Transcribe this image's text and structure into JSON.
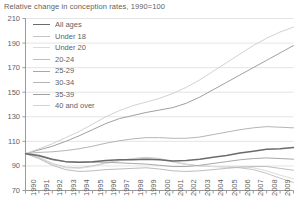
{
  "chart_data": {
    "type": "line",
    "title": "Relative change in conception rates, 1990=100",
    "xlabel": "",
    "ylabel": "",
    "grid": true,
    "legend_position": "top-left",
    "xlim": [
      1990,
      2010
    ],
    "ylim": [
      70,
      210
    ],
    "yticks": [
      70,
      90,
      110,
      130,
      150,
      170,
      190,
      210
    ],
    "x": [
      1990,
      1991,
      1992,
      1993,
      1994,
      1995,
      1996,
      1997,
      1998,
      1999,
      2000,
      2001,
      2002,
      2003,
      2004,
      2005,
      2006,
      2007,
      2008,
      2009,
      2010
    ],
    "xticklabels": [
      "1990",
      "1991",
      "1992",
      "1993",
      "1994",
      "1995",
      "1996",
      "1997",
      "1998",
      "1999",
      "2000",
      "2001",
      "2002",
      "2003",
      "2004",
      "2005",
      "2006",
      "2007",
      "2008",
      "2009",
      "2010"
    ],
    "series": [
      {
        "name": "All ages",
        "color": "#6b6b6b",
        "width": 1.5,
        "values": [
          100,
          98.5,
          95.5,
          93.5,
          93,
          93.5,
          94.5,
          95,
          95,
          95.5,
          95,
          94,
          94.5,
          95.5,
          97,
          98.5,
          100.5,
          102,
          103.5,
          104,
          105
        ]
      },
      {
        "name": "Under 18",
        "color": "#c4c4c4",
        "width": 1.0,
        "values": [
          100,
          97,
          92,
          89,
          88.5,
          90,
          92.5,
          94.5,
          96,
          97,
          96,
          93.5,
          91.5,
          90,
          89.5,
          89,
          88.5,
          87,
          84,
          80,
          76.5
        ]
      },
      {
        "name": "Under 20",
        "color": "#dcdcdc",
        "width": 1.0,
        "values": [
          100,
          96.5,
          91.5,
          88.5,
          88,
          89.5,
          92,
          94,
          95.5,
          96.5,
          95.5,
          93,
          91,
          90,
          89.5,
          89.5,
          89.5,
          88.5,
          86,
          82.5,
          79.5
        ]
      },
      {
        "name": "20-24",
        "color": "#bdbdbd",
        "width": 1.0,
        "values": [
          100,
          96,
          90.5,
          87,
          85.5,
          86,
          87,
          87.5,
          88,
          88.5,
          87.5,
          86,
          85.5,
          86,
          87,
          88,
          89,
          89.5,
          89.5,
          88,
          86.5
        ]
      },
      {
        "name": "25-29",
        "color": "#a8a8a8",
        "width": 1.0,
        "values": [
          100,
          98,
          95,
          93.5,
          93,
          93,
          93,
          92.5,
          92,
          91.5,
          90.5,
          89.5,
          89.5,
          90.5,
          92,
          93.5,
          95,
          96,
          96.5,
          96,
          95.5
        ]
      },
      {
        "name": "30-34",
        "color": "#b5b5b5",
        "width": 1.0,
        "values": [
          100,
          101,
          101.5,
          102.5,
          104,
          106,
          108.5,
          110.5,
          112,
          113,
          113,
          112.5,
          112.5,
          113.5,
          115.5,
          117.5,
          119.5,
          121,
          122,
          121.5,
          121
        ]
      },
      {
        "name": "35-39",
        "color": "#a0a0a0",
        "width": 1.0,
        "values": [
          100,
          103,
          106,
          110,
          114.5,
          119.5,
          124.5,
          128.5,
          131,
          133.5,
          135.5,
          137.5,
          141,
          146,
          152,
          158,
          164,
          170,
          176,
          182,
          188
        ]
      },
      {
        "name": "40 and over",
        "color": "#d2d2d2",
        "width": 1.0,
        "values": [
          100,
          104,
          108,
          113,
          118,
          124,
          130,
          135,
          139,
          142,
          145,
          149,
          154,
          160,
          167,
          174,
          181,
          188,
          194,
          199,
          203
        ]
      }
    ]
  }
}
